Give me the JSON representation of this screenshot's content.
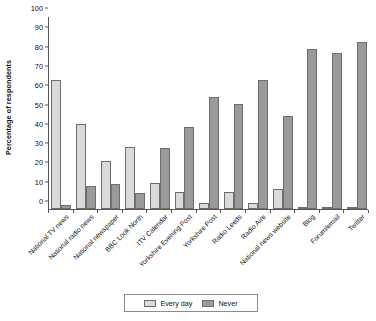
{
  "chart_data": {
    "type": "bar",
    "title": "",
    "subtitle": "",
    "xlabel": "",
    "ylabel": "Percentage of respondents",
    "ylim": [
      0,
      100
    ],
    "ytick_step": 10,
    "yticks": [
      0,
      10,
      20,
      30,
      40,
      50,
      60,
      70,
      80,
      90,
      100
    ],
    "grid": false,
    "legend_position": "bottom-center",
    "categories": [
      "National TV news",
      "National radio news",
      "National newspaper",
      "BBC Look North",
      "ITV Calendar",
      "Yorkshire Evening Post",
      "Yorkshire Post",
      "Radio Leeds",
      "Radio Aire",
      "National news website",
      "Blog",
      "Forum/email",
      "Twitter"
    ],
    "series": [
      {
        "name": "Every day",
        "color": "#dadada",
        "values": [
          67,
          44,
          25,
          32,
          13.5,
          9,
          3,
          9,
          3,
          10.5,
          0.5,
          1,
          1
        ]
      },
      {
        "name": "Never",
        "color": "#9a9a9a",
        "values": [
          2,
          12,
          13,
          8.5,
          31.5,
          42.5,
          58,
          54.5,
          67,
          48,
          83,
          81,
          86.5
        ]
      }
    ]
  },
  "legend": {
    "items": [
      {
        "label": "Every day",
        "swatch": "every-day"
      },
      {
        "label": "Never",
        "swatch": "never"
      }
    ]
  },
  "colors": {
    "every_day": "#dadada",
    "never": "#9a9a9a",
    "axis": "#555555",
    "text": "#111111",
    "background": "#ffffff"
  }
}
